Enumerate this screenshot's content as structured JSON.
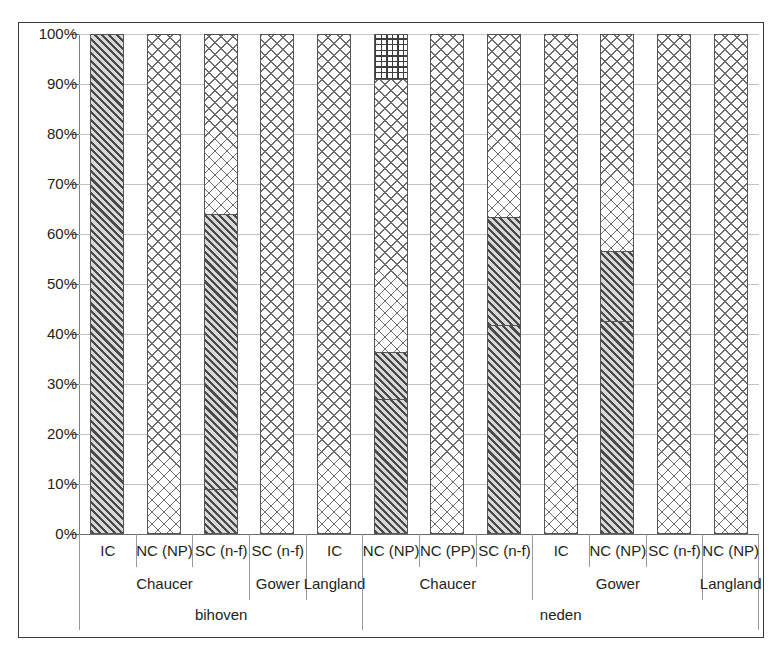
{
  "chart_data": {
    "type": "bar",
    "subtype": "stacked-100-percent",
    "title": "",
    "xlabel": "",
    "ylabel": "",
    "ylim": [
      0,
      100
    ],
    "ytick_labels": [
      "100%",
      "90%",
      "80%",
      "70%",
      "60%",
      "50%",
      "40%",
      "30%",
      "20%",
      "10%",
      "0%"
    ],
    "ytick_values": [
      100,
      90,
      80,
      70,
      60,
      50,
      40,
      30,
      20,
      10,
      0
    ],
    "grid": true,
    "legend": "none",
    "series": [
      {
        "name": "diagonal-hatch-dark",
        "pattern": "diagonal-hatch",
        "values": [
          100,
          0,
          9,
          0,
          0,
          27,
          0,
          41.8,
          0,
          42.6,
          0,
          0
        ]
      },
      {
        "name": "diagonal-hatch-dark-upper",
        "pattern": "diagonal-hatch",
        "values": [
          0,
          0,
          55,
          0,
          0,
          9.4,
          0,
          21.6,
          0,
          14,
          0,
          0
        ]
      },
      {
        "name": "cross-hatch-light",
        "pattern": "cross-hatch",
        "values": [
          0,
          100,
          36,
          100,
          100,
          54.6,
          100,
          36.6,
          100,
          43.4,
          100,
          100
        ]
      },
      {
        "name": "fine-grid",
        "pattern": "fine-grid",
        "values": [
          0,
          0,
          0,
          0,
          0,
          9,
          0,
          0,
          0,
          0,
          0,
          0
        ]
      }
    ],
    "categories": [
      "IC",
      "NC (NP)",
      "SC (n-f)",
      "SC (n-f)",
      "IC",
      "NC (NP)",
      "NC (PP)",
      "SC (n-f)",
      "IC",
      "NC (NP)",
      "SC (n-f)",
      "NC (NP)"
    ],
    "bars": [
      {
        "index": 0,
        "category": "IC",
        "author": "Chaucer",
        "verb": "bihoven",
        "segments": [
          {
            "pattern": "diagonal-hatch",
            "from": 0,
            "to": 100
          }
        ]
      },
      {
        "index": 1,
        "category": "NC (NP)",
        "author": "Chaucer",
        "verb": "bihoven",
        "segments": [
          {
            "pattern": "cross-hatch",
            "from": 0,
            "to": 100
          }
        ]
      },
      {
        "index": 2,
        "category": "SC (n-f)",
        "author": "Chaucer",
        "verb": "bihoven",
        "segments": [
          {
            "pattern": "diagonal-hatch",
            "from": 0,
            "to": 9
          },
          {
            "pattern": "diagonal-hatch",
            "from": 9,
            "to": 64
          },
          {
            "pattern": "cross-hatch",
            "from": 64,
            "to": 100
          }
        ]
      },
      {
        "index": 3,
        "category": "SC (n-f)",
        "author": "Gower",
        "verb": "bihoven",
        "segments": [
          {
            "pattern": "cross-hatch",
            "from": 0,
            "to": 100
          }
        ]
      },
      {
        "index": 4,
        "category": "IC",
        "author": "Langland",
        "verb": "bihoven",
        "segments": [
          {
            "pattern": "cross-hatch",
            "from": 0,
            "to": 100
          }
        ]
      },
      {
        "index": 5,
        "category": "NC (NP)",
        "author": "Chaucer",
        "verb": "neden",
        "segments": [
          {
            "pattern": "diagonal-hatch",
            "from": 0,
            "to": 27
          },
          {
            "pattern": "diagonal-hatch",
            "from": 27,
            "to": 36.4
          },
          {
            "pattern": "cross-hatch",
            "from": 36.4,
            "to": 91
          },
          {
            "pattern": "fine-grid",
            "from": 91,
            "to": 100
          }
        ]
      },
      {
        "index": 6,
        "category": "NC (PP)",
        "author": "Chaucer",
        "verb": "neden",
        "segments": [
          {
            "pattern": "cross-hatch",
            "from": 0,
            "to": 100
          }
        ]
      },
      {
        "index": 7,
        "category": "SC (n-f)",
        "author": "Chaucer",
        "verb": "neden",
        "segments": [
          {
            "pattern": "diagonal-hatch",
            "from": 0,
            "to": 41.8
          },
          {
            "pattern": "diagonal-hatch",
            "from": 41.8,
            "to": 63.4
          },
          {
            "pattern": "cross-hatch",
            "from": 63.4,
            "to": 100
          }
        ]
      },
      {
        "index": 8,
        "category": "IC",
        "author": "Gower",
        "verb": "neden",
        "segments": [
          {
            "pattern": "cross-hatch",
            "from": 0,
            "to": 100
          }
        ]
      },
      {
        "index": 9,
        "category": "NC (NP)",
        "author": "Gower",
        "verb": "neden",
        "segments": [
          {
            "pattern": "diagonal-hatch",
            "from": 0,
            "to": 42.6
          },
          {
            "pattern": "diagonal-hatch",
            "from": 42.6,
            "to": 56.6
          },
          {
            "pattern": "cross-hatch",
            "from": 56.6,
            "to": 100
          }
        ]
      },
      {
        "index": 10,
        "category": "SC (n-f)",
        "author": "Gower",
        "verb": "neden",
        "segments": [
          {
            "pattern": "cross-hatch",
            "from": 0,
            "to": 100
          }
        ]
      },
      {
        "index": 11,
        "category": "NC (NP)",
        "author": "Langland",
        "verb": "neden",
        "segments": [
          {
            "pattern": "cross-hatch",
            "from": 0,
            "to": 100
          }
        ]
      }
    ],
    "author_groups": [
      {
        "label": "Chaucer",
        "start": 0,
        "span": 3
      },
      {
        "label": "Gower",
        "start": 3,
        "span": 1
      },
      {
        "label": "Langland",
        "start": 4,
        "span": 1
      },
      {
        "label": "Chaucer",
        "start": 5,
        "span": 3
      },
      {
        "label": "Gower",
        "start": 8,
        "span": 3
      },
      {
        "label": "Langland",
        "start": 11,
        "span": 1
      }
    ],
    "verb_groups": [
      {
        "label": "bihoven",
        "start": 0,
        "span": 5
      },
      {
        "label": "neden",
        "start": 5,
        "span": 7
      }
    ],
    "colors": {
      "hatch_dark": "#4a4a4a",
      "hatch_light": "#6d6d6d",
      "grid_pattern": "#3d3d3d",
      "gridline": "#c2c2c2",
      "axis": "#6b6b6b",
      "frame": "#3a3a3a",
      "text": "#231f20",
      "background": "#ffffff"
    }
  }
}
